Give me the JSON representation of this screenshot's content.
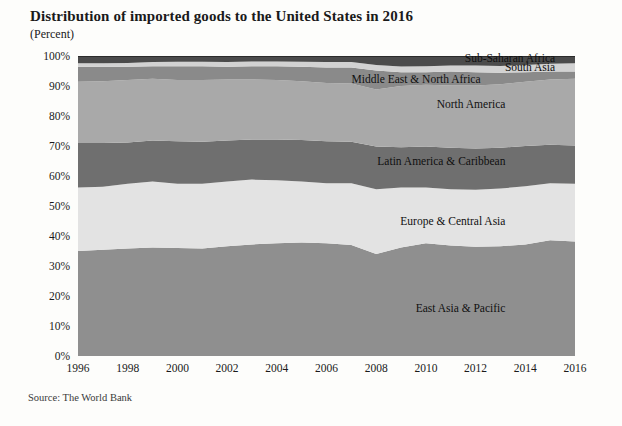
{
  "header": {
    "title": "Distribution of imported goods to the United States in 2016",
    "subtitle": "(Percent)"
  },
  "footer": {
    "source": "Source: The World Bank"
  },
  "chart_data": {
    "type": "area",
    "stacked": true,
    "title": "Distribution of imported goods to the United States in 2016",
    "subtitle": "(Percent)",
    "xlabel": "",
    "ylabel": "(Percent)",
    "xlim": [
      1996,
      2016
    ],
    "ylim": [
      0,
      100
    ],
    "grid": false,
    "legend_position": "inline-right",
    "source": "Source: The World Bank",
    "x": [
      1996,
      1997,
      1998,
      1999,
      2000,
      2001,
      2002,
      2003,
      2004,
      2005,
      2006,
      2007,
      2008,
      2009,
      2010,
      2011,
      2012,
      2013,
      2014,
      2015,
      2016
    ],
    "xticks": [
      1996,
      1998,
      2000,
      2002,
      2004,
      2006,
      2008,
      2010,
      2012,
      2014,
      2016
    ],
    "xtick_labels": [
      "1996",
      "1998",
      "2000",
      "2002",
      "2004",
      "2006",
      "2008",
      "2010",
      "2012",
      "2014",
      "2016"
    ],
    "yticks": [
      0,
      10,
      20,
      30,
      40,
      50,
      60,
      70,
      80,
      90,
      100
    ],
    "ytick_labels": [
      "0%",
      "10%",
      "20%",
      "30%",
      "40%",
      "50%",
      "60%",
      "70%",
      "80%",
      "90%",
      "100%"
    ],
    "series": [
      {
        "name": "East Asia & Pacific",
        "color": "#8f8f8f",
        "label_x": 2013.2,
        "label_y": 16,
        "values": [
          35.0,
          35.4,
          35.8,
          36.2,
          36.0,
          35.8,
          36.6,
          37.2,
          37.6,
          37.8,
          37.6,
          37.0,
          34.0,
          36.2,
          37.6,
          36.8,
          36.4,
          36.6,
          37.2,
          38.6,
          38.2
        ]
      },
      {
        "name": "Europe & Central Asia",
        "color": "#e3e3e3",
        "label_x": 2013.2,
        "label_y": 45,
        "values": [
          21.2,
          21.0,
          21.6,
          22.0,
          21.4,
          21.6,
          21.6,
          21.6,
          21.0,
          20.4,
          20.0,
          20.6,
          21.6,
          20.0,
          18.6,
          18.8,
          19.0,
          19.2,
          19.4,
          19.0,
          19.2
        ]
      },
      {
        "name": "Latin America & Caribbean",
        "color": "#6f6f6f",
        "label_x": 2013.2,
        "label_y": 65,
        "values": [
          14.8,
          14.6,
          13.8,
          13.6,
          14.2,
          14.0,
          13.6,
          13.4,
          13.6,
          13.8,
          14.0,
          13.8,
          14.2,
          13.4,
          13.6,
          13.8,
          13.8,
          13.6,
          13.4,
          12.8,
          12.8
        ]
      },
      {
        "name": "North America",
        "color": "#a9a9a9",
        "label_x": 2013.2,
        "label_y": 84,
        "values": [
          20.4,
          20.6,
          20.8,
          20.6,
          20.4,
          20.6,
          20.4,
          20.0,
          19.8,
          19.6,
          19.4,
          19.4,
          19.0,
          20.4,
          20.6,
          20.8,
          21.0,
          21.2,
          21.4,
          21.8,
          22.2
        ]
      },
      {
        "name": "Middle East & North Africa",
        "color": "#8a8a8a",
        "label_x": 2012.2,
        "label_y": 92.5,
        "values": [
          5.0,
          4.8,
          4.4,
          4.2,
          4.6,
          4.6,
          4.2,
          4.4,
          4.6,
          4.8,
          5.2,
          5.4,
          6.4,
          4.6,
          4.2,
          4.6,
          4.4,
          3.8,
          3.2,
          2.6,
          2.4
        ]
      },
      {
        "name": "South Asia",
        "color": "#d2d2d2",
        "label_x": 2015.2,
        "label_y": 96.3,
        "values": [
          1.2,
          1.2,
          1.3,
          1.4,
          1.5,
          1.5,
          1.6,
          1.6,
          1.6,
          1.7,
          1.8,
          1.8,
          1.8,
          1.9,
          2.0,
          2.0,
          2.2,
          2.3,
          2.4,
          2.6,
          2.8
        ]
      },
      {
        "name": "Sub-Saharan Africa",
        "color": "#4b4b4b",
        "label_x": 2015.2,
        "label_y": 99.3,
        "values": [
          2.4,
          2.4,
          2.3,
          2.0,
          1.9,
          1.9,
          2.0,
          1.8,
          1.8,
          1.9,
          2.0,
          2.0,
          3.0,
          3.5,
          3.4,
          3.2,
          3.2,
          3.3,
          3.0,
          2.6,
          2.4
        ]
      }
    ]
  }
}
